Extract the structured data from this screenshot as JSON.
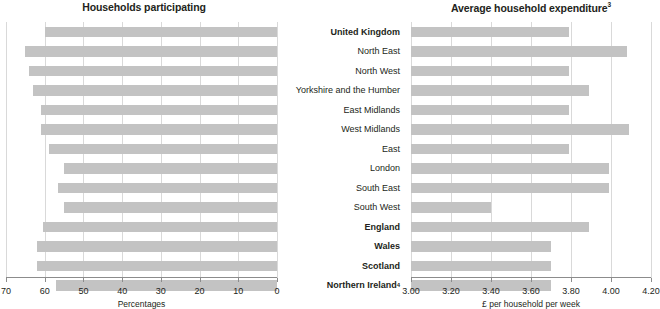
{
  "categories": [
    {
      "label": "United Kingdom",
      "bold": true,
      "sup": ""
    },
    {
      "label": "North East",
      "bold": false,
      "sup": ""
    },
    {
      "label": "North West",
      "bold": false,
      "sup": ""
    },
    {
      "label": "Yorkshire and the Humber",
      "bold": false,
      "sup": ""
    },
    {
      "label": "East Midlands",
      "bold": false,
      "sup": ""
    },
    {
      "label": "West Midlands",
      "bold": false,
      "sup": ""
    },
    {
      "label": "East",
      "bold": false,
      "sup": ""
    },
    {
      "label": "London",
      "bold": false,
      "sup": ""
    },
    {
      "label": "South East",
      "bold": false,
      "sup": ""
    },
    {
      "label": "South West",
      "bold": false,
      "sup": ""
    },
    {
      "label": "England",
      "bold": true,
      "sup": ""
    },
    {
      "label": "Wales",
      "bold": true,
      "sup": ""
    },
    {
      "label": "Scotland",
      "bold": true,
      "sup": ""
    },
    {
      "label": "Northern Ireland",
      "bold": true,
      "sup": "4"
    }
  ],
  "colors": {
    "bar": "#c3c3c3",
    "grid": "#d9d9d9",
    "axis": "#8c8c8c",
    "text": "#231f20"
  },
  "chart_data": [
    {
      "type": "bar",
      "orientation": "horizontal",
      "title": "Households participating",
      "title_sup": "",
      "xlabel": "Percentages",
      "ylabel": "",
      "xlim": [
        70,
        0
      ],
      "reversed_axis": true,
      "grid": true,
      "ticks": [
        70,
        60,
        50,
        40,
        30,
        20,
        10,
        0
      ],
      "tick_labels": [
        "70",
        "60",
        "50",
        "40",
        "30",
        "20",
        "10",
        "0"
      ],
      "categories": [
        "United Kingdom",
        "North East",
        "North West",
        "Yorkshire and the Humber",
        "East Midlands",
        "West Midlands",
        "East",
        "London",
        "South East",
        "South West",
        "England",
        "Wales",
        "Scotland",
        "Northern Ireland"
      ],
      "values": [
        60.0,
        65.0,
        64.0,
        63.0,
        61.0,
        61.0,
        59.0,
        55.0,
        56.5,
        55.0,
        60.5,
        62.0,
        62.0,
        57.0
      ]
    },
    {
      "type": "bar",
      "orientation": "horizontal",
      "title": "Average household expenditure",
      "title_sup": "3",
      "xlabel": "£ per household per week",
      "ylabel": "",
      "xlim": [
        3.0,
        4.2
      ],
      "reversed_axis": false,
      "grid": true,
      "ticks": [
        3.0,
        3.2,
        3.4,
        3.6,
        3.8,
        4.0,
        4.2
      ],
      "tick_labels": [
        "3.00",
        "3.20",
        "3.40",
        "3.60",
        "3.80",
        "4.00",
        "4.20"
      ],
      "categories": [
        "United Kingdom",
        "North East",
        "North West",
        "Yorkshire and the Humber",
        "East Midlands",
        "West Midlands",
        "East",
        "London",
        "South East",
        "South West",
        "England",
        "Wales",
        "Scotland",
        "Northern Ireland"
      ],
      "values": [
        3.79,
        4.08,
        3.79,
        3.89,
        3.79,
        4.09,
        3.79,
        3.99,
        3.99,
        3.4,
        3.89,
        3.7,
        3.7,
        3.7
      ]
    }
  ]
}
